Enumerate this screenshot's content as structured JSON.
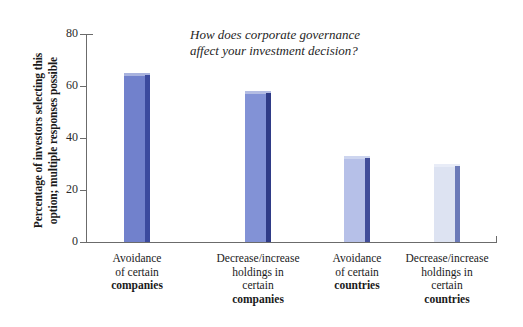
{
  "chart_data": {
    "type": "bar",
    "title": "How does corporate governance affect your investment decision?",
    "title_line1": "How does corporate governance",
    "title_line2": "affect your investment decision?",
    "xlabel": "",
    "ylabel": "Percentage of investors selecting this option; multiple responses possible",
    "ylabel_line1": "Percentage of investors selecting this",
    "ylabel_line2": "option; multiple responses possible",
    "ylim": [
      0,
      80
    ],
    "yticks": [
      0,
      20,
      40,
      60,
      80
    ],
    "ytick_labels": [
      "0",
      "20",
      "40",
      "60",
      "80"
    ],
    "grid": false,
    "legend": "none",
    "categories": [
      "Avoidance of certain companies",
      "Decrease/increase holdings in certain companies",
      "Avoidance of certain countries",
      "Decrease/increase holdings in certain countries"
    ],
    "values": [
      64,
      57,
      32,
      29
    ],
    "bar_colors": [
      "#7181cc",
      "#8292d6",
      "#b6c0e8",
      "#dde3f2"
    ],
    "bar_side_colors": [
      "#3b4a9e",
      "#2f3b87",
      "#414d99",
      "#6b7ab8"
    ],
    "bar_top_colors": [
      "#a8b2de",
      "#b3bce3",
      "#cdd5ef",
      "#e8ecf7"
    ]
  },
  "categories_wrapped": [
    {
      "lines": [
        "Avoidance",
        "of certain"
      ],
      "emphasis": "companies"
    },
    {
      "lines": [
        "Decrease/increase",
        "holdings in",
        "certain"
      ],
      "emphasis": "companies"
    },
    {
      "lines": [
        "Avoidance",
        "of certain"
      ],
      "emphasis": "countries"
    },
    {
      "lines": [
        "Decrease/increase",
        "holdings in",
        "certain"
      ],
      "emphasis": "countries"
    }
  ]
}
